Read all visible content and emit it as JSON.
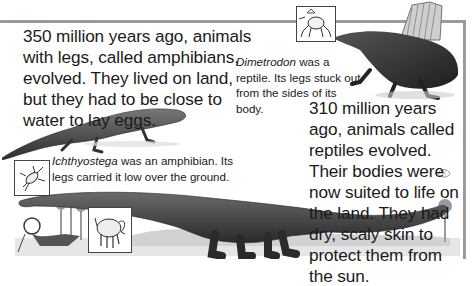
{
  "page": {
    "paragraphs": {
      "amphibians": "350 million years ago, animals with legs, called amphibians, evolved. They lived on land, but they had to be close to water to lay eggs.",
      "reptiles": "310 million years ago, animals called reptiles evolved. Their bodies were now suited to life on the land. They had dry, scaly skin to protect them from the sun."
    },
    "captions": {
      "dimetrodon": {
        "name": "Dimetrodon",
        "text": " was a reptile. Its legs stuck out from the sides of its body."
      },
      "ichthyostega": {
        "name": "Ichthyostega",
        "text": " was an amphibian. Its legs carried it low over the ground."
      }
    },
    "icons": [
      {
        "name": "dimetrodon-posture-icon"
      },
      {
        "name": "ichthyostega-posture-icon"
      },
      {
        "name": "sauropod-posture-icon"
      }
    ],
    "colors": {
      "rule": "#9a9a9a",
      "text": "#1a1a1a",
      "ink": "#3a3a3a"
    }
  }
}
